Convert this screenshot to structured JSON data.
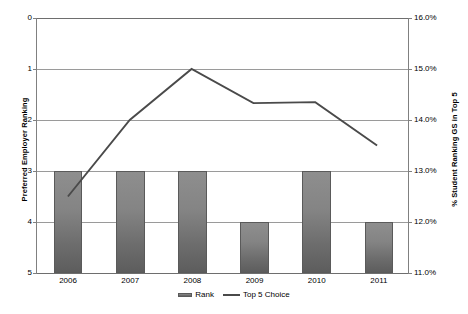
{
  "chart_data": {
    "type": "bar",
    "title": "",
    "categories": [
      "2006",
      "2007",
      "2008",
      "2009",
      "2010",
      "2011"
    ],
    "xlabel": "",
    "grid": true,
    "legend_position": "bottom",
    "series": [
      {
        "name": "Rank",
        "type": "bar",
        "axis": "left",
        "values": [
          3,
          3,
          3,
          4,
          3,
          4
        ],
        "baseline": 5,
        "color": "#7a7a7a"
      },
      {
        "name": "Top 5 Choice",
        "type": "line",
        "axis": "right",
        "values": [
          12.5,
          14.0,
          15.0,
          14.33,
          14.35,
          13.5
        ],
        "color": "#4a4a4a"
      }
    ],
    "left_axis": {
      "label": "Preferred Employer Ranking",
      "ticks": [
        "0",
        "1",
        "2",
        "3",
        "4",
        "5"
      ],
      "values": [
        0,
        1,
        2,
        3,
        4,
        5
      ],
      "min": 0,
      "max": 5,
      "inverted": true
    },
    "right_axis": {
      "label": "% Student Ranking GS in Top 5",
      "ticks": [
        "16.0%",
        "15.0%",
        "14.0%",
        "13.0%",
        "12.0%",
        "11.0%"
      ],
      "values": [
        16.0,
        15.0,
        14.0,
        13.0,
        12.0,
        11.0
      ],
      "min": 11.0,
      "max": 16.0,
      "inverted": false
    }
  },
  "legend": {
    "items": [
      {
        "label": "Rank",
        "marker": "bar-swatch-icon"
      },
      {
        "label": "Top 5 Choice",
        "marker": "line-swatch-icon"
      }
    ]
  }
}
